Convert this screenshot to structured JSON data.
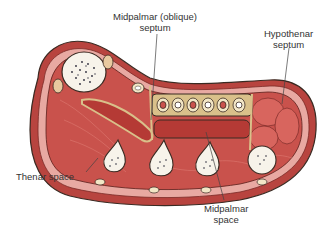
{
  "figure": {
    "labels": {
      "midpalmar_septum": [
        "Midpalmar (oblique)",
        "septum"
      ],
      "hypothenar_septum": [
        "Hypothenar",
        "septum"
      ],
      "thenar_space": "Thenar space",
      "midpalmar_space": [
        "Midpalmar",
        "space"
      ]
    },
    "colors": {
      "skin_outer": "#b8443f",
      "skin_inner": "#e8a9a2",
      "muscle": "#c9524c",
      "muscle_light": "#e07c74",
      "bone": "#f7f3ea",
      "bone_speckle": "#2a2a3a",
      "tendon_sheath": "#d9c08a",
      "space_fill": "#b53a35",
      "outline": "#3a2a22",
      "leader_line": "#444444"
    }
  }
}
